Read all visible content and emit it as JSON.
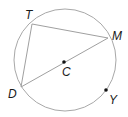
{
  "diagram": {
    "type": "circle-geometry",
    "circle": {
      "cx": 65,
      "cy": 60,
      "r": 51,
      "stroke": "#a8a8a8"
    },
    "segment_color": "#a0a0a0",
    "points": {
      "T": {
        "label": "T",
        "x": 32,
        "y": 24,
        "lx": 25,
        "ly": 19
      },
      "M": {
        "label": "M",
        "x": 108,
        "y": 38,
        "lx": 112,
        "ly": 40
      },
      "D": {
        "label": "D",
        "x": 21,
        "y": 87,
        "lx": 8,
        "ly": 98
      },
      "C": {
        "label": "C",
        "x": 64,
        "y": 62,
        "lx": 62,
        "ly": 76
      },
      "Y": {
        "label": "Y",
        "x": 106,
        "y": 90,
        "lx": 109,
        "ly": 104
      }
    },
    "segments": [
      {
        "from": "T",
        "to": "M",
        "name": "chord-TM"
      },
      {
        "from": "T",
        "to": "D",
        "name": "chord-TD"
      },
      {
        "from": "D",
        "to": "M",
        "name": "diameter-DM"
      }
    ],
    "labels": {
      "T": "T",
      "M": "M",
      "D": "D",
      "C": "C",
      "Y": "Y"
    }
  }
}
